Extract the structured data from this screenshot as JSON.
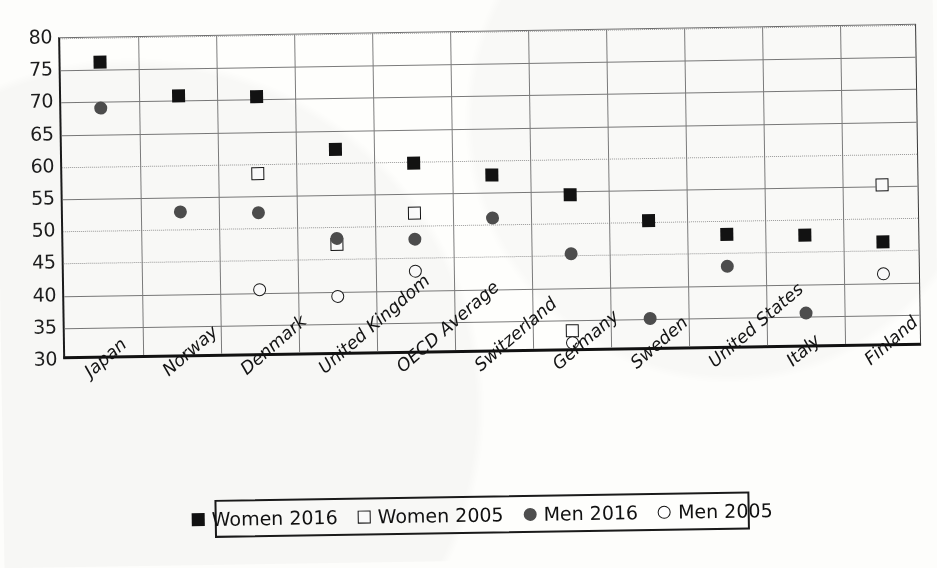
{
  "chart_data": {
    "type": "scatter",
    "title": "",
    "subtitle": "",
    "xlabel": "",
    "ylabel": "",
    "ylim": [
      30,
      80
    ],
    "ytick_step": 5,
    "yticks": [
      "80",
      "75",
      "70",
      "65",
      "60",
      "55",
      "50",
      "45",
      "40",
      "35",
      "30"
    ],
    "grid": "both",
    "legend_position": "bottom",
    "categories": [
      "Japan",
      "Norway",
      "Denmark",
      "United Kingdom",
      "OECD Average",
      "Switzerland",
      "Germany",
      "Sweden",
      "United States",
      "Italy",
      "Finland"
    ],
    "series": [
      {
        "name": "Women 2016",
        "marker": "filled-square",
        "color": "#121212",
        "values": [
          76.2,
          70.7,
          70.4,
          62.0,
          59.8,
          57.7,
          54.5,
          50.3,
          47.9,
          47.6,
          46.4
        ]
      },
      {
        "name": "Women 2005",
        "marker": "open-square",
        "color": "#141414",
        "values": [
          null,
          null,
          58.5,
          47.3,
          52.0,
          null,
          33.3,
          null,
          null,
          null,
          55.2
        ]
      },
      {
        "name": "Men 2016",
        "marker": "filled-circle",
        "color": "#4e4e4e",
        "values": [
          69.0,
          52.8,
          52.5,
          48.3,
          48.0,
          51.0,
          45.3,
          35.1,
          42.9,
          35.5,
          null
        ]
      },
      {
        "name": "Men 2005",
        "marker": "open-circle",
        "color": "#1a1a1a",
        "values": [
          null,
          null,
          40.5,
          39.2,
          43.0,
          null,
          31.5,
          null,
          null,
          null,
          41.4
        ]
      }
    ]
  },
  "legend": {
    "items": [
      {
        "label": "Women 2016",
        "marker": "filled-square"
      },
      {
        "label": "Women 2005",
        "marker": "open-square"
      },
      {
        "label": "Men 2016",
        "marker": "filled-circle"
      },
      {
        "label": "Men 2005",
        "marker": "open-circle"
      }
    ]
  }
}
